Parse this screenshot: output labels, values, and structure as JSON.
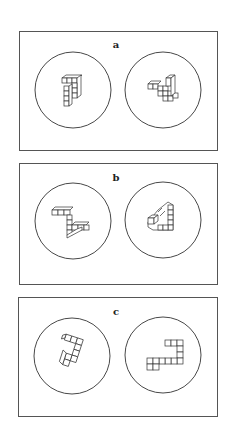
{
  "figure": {
    "panels": [
      {
        "id": "a",
        "label": "a",
        "description": "Pair of 3D cube-block shapes in circles (rotated views)"
      },
      {
        "id": "b",
        "label": "b",
        "description": "Pair of 3D cube-block shapes in circles (mirror pair)"
      },
      {
        "id": "c",
        "label": "c",
        "description": "Pair of 3D cube-block shapes in circles (flat views)"
      }
    ]
  },
  "colors": {
    "line": "#333333",
    "background": "#ffffff"
  }
}
